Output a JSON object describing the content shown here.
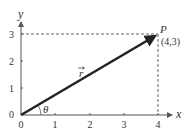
{
  "diagram": {
    "axes": {
      "x_label": "x",
      "y_label": "y",
      "x_ticks": [
        "0",
        "1",
        "2",
        "3",
        "4"
      ],
      "y_ticks": [
        "0",
        "1",
        "2",
        "3"
      ]
    },
    "vector": {
      "label": "r",
      "from": [
        0,
        0
      ],
      "to": [
        4,
        3
      ]
    },
    "point": {
      "name": "P",
      "coords_label": "(4,3)"
    },
    "angle": {
      "label": "θ"
    },
    "colors": {
      "axis": "#555555",
      "vector": "#222222",
      "dashed": "#666666",
      "text": "#333333"
    }
  }
}
